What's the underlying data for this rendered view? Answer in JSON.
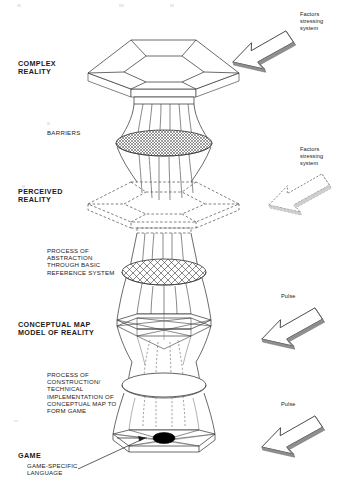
{
  "diagram": {
    "stages": [
      {
        "id": "complex-reality",
        "label": "COMPLEX\nREALITY"
      },
      {
        "id": "perceived-reality",
        "label": "PERCEIVED\nREALITY"
      },
      {
        "id": "conceptual-map",
        "label": "CONCEPTUAL MAP\nMODEL OF REALITY"
      }
    ],
    "barriers_label": "BARRIERS",
    "process_labels": [
      {
        "id": "process-abstraction",
        "label": "PROCESS OF\nABSTRACTION\nTHROUGH BASIC\nREFERENCE SYSTEM"
      },
      {
        "id": "process-construction",
        "label": "PROCESS OF\nCONSTRUCTION/\nTECHNICAL\nIMPLEMENTATION OF\nCONCEPTUAL MAP TO\nFORM GAME"
      }
    ],
    "game": {
      "title": "GAME",
      "subtitle": "GAME-SPECIFIC\nLANGUAGE"
    },
    "side_annotations": [
      {
        "id": "factors-stressing-system-top",
        "label": "Factors\nstressing\nsystem",
        "arrow": "solid-arrow-down-left"
      },
      {
        "id": "factors-stressing-system-middle",
        "label": "Factors\nstressing\nsystem",
        "arrow": "dashed-arrow-down-left"
      },
      {
        "id": "pulse-upper",
        "label": "Pulse",
        "arrow": "solid-arrow-down-left"
      },
      {
        "id": "pulse-lower",
        "label": "Pulse",
        "arrow": "solid-arrow-down-left"
      }
    ],
    "colors": {
      "stroke": "#3a3a3a",
      "stroke_light": "#6e6e6e",
      "dashed": "#555555",
      "fill_white": "#ffffff",
      "fill_dark": "#000000",
      "arrow_shadow": "#8a8a8a",
      "background": "#ffffff"
    }
  }
}
